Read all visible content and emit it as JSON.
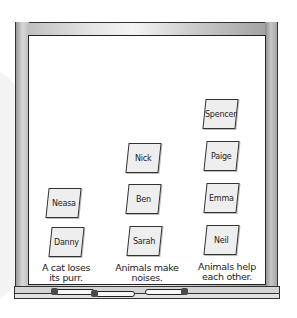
{
  "board": {
    "columns": [
      {
        "label_line1": "A cat loses",
        "label_line2": "its purr.",
        "notes": [
          "Neasa",
          "Danny"
        ]
      },
      {
        "label_line1": "Animals make",
        "label_line2": "noises.",
        "notes": [
          "Nick",
          "Ben",
          "Sarah"
        ]
      },
      {
        "label_line1": "Animals help",
        "label_line2": "each other.",
        "notes": [
          "Spencer",
          "Paige",
          "Emma",
          "Neil"
        ]
      }
    ]
  },
  "colors": {
    "note_fill": "#eeeeee",
    "frame": "#c0c0c0",
    "board": "#ffffff",
    "outline": "#333333"
  }
}
